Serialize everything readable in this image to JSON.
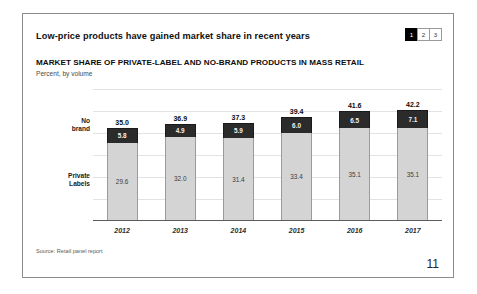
{
  "slide": {
    "title": "Low-price products have gained market share in recent years",
    "page_number": "11",
    "source_note": "Source: Retail panel report",
    "page_chips": [
      {
        "label": "1",
        "active": true
      },
      {
        "label": "2",
        "active": false
      },
      {
        "label": "3",
        "active": false
      }
    ]
  },
  "chart_data": {
    "type": "bar",
    "subtype": "stacked-column",
    "title": "MARKET SHARE OF PRIVATE-LABEL AND NO-BRAND PRODUCTS IN MASS RETAIL",
    "subtitle": "Percent, by volume",
    "xlabel": "",
    "ylabel": "",
    "ylim": [
      0,
      50
    ],
    "grid": true,
    "legend_position": "left-inline",
    "categories": [
      "2012",
      "2013",
      "2014",
      "2015",
      "2016",
      "2017"
    ],
    "series": [
      {
        "name": "Private Labels",
        "color": "#d4d4d4",
        "values": [
          29.6,
          32.0,
          31.4,
          33.4,
          35.1,
          35.1
        ],
        "labels": [
          "29.6",
          "32.0",
          "31.4",
          "33.4",
          "35.1",
          "35.1"
        ]
      },
      {
        "name": "No brand",
        "color": "#2b2b2b",
        "values": [
          5.8,
          4.9,
          5.9,
          6.0,
          6.5,
          7.1
        ],
        "labels": [
          "5.8",
          "4.9",
          "5.9",
          "6.0",
          "6.5",
          "7.1"
        ]
      }
    ],
    "totals": [
      35.0,
      36.9,
      37.3,
      39.4,
      41.6,
      42.2
    ],
    "total_labels": [
      "35.0",
      "36.9",
      "37.3",
      "39.4",
      "41.6",
      "42.2"
    ],
    "series_side_labels": {
      "no_brand_line1": "No",
      "no_brand_line2": "brand",
      "private_line1": "Private",
      "private_line2": "Labels"
    }
  },
  "colors": {
    "no_brand": "#2b2b2b",
    "private_labels": "#d4d4d4",
    "chip_active_bg": "#000000",
    "frame_border": "#8c8c8c"
  }
}
